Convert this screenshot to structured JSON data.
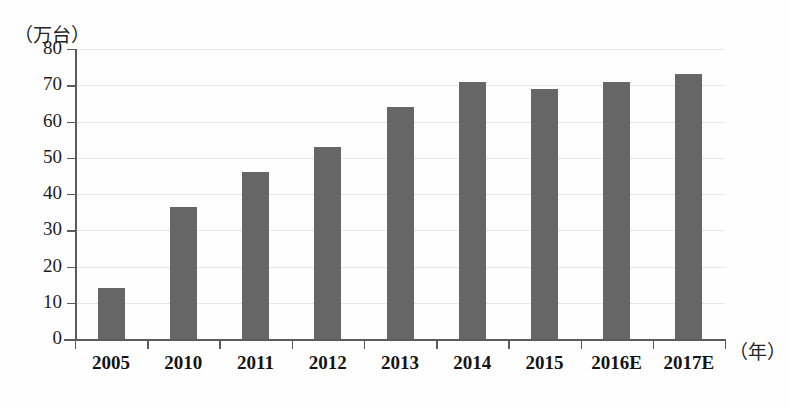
{
  "chart_data": {
    "type": "bar",
    "title": "",
    "subtitle": "",
    "xlabel": "（年）",
    "ylabel": "（万台）",
    "categories": [
      "2005",
      "2010",
      "2011",
      "2012",
      "2013",
      "2014",
      "2015",
      "2016E",
      "2017E"
    ],
    "values": [
      14,
      36.5,
      46,
      53,
      64,
      71,
      69,
      71,
      73
    ],
    "ylim": [
      0,
      80
    ],
    "ytick_labels": [
      "0",
      "10",
      "20",
      "30",
      "40",
      "50",
      "60",
      "70",
      "80"
    ],
    "ytick_values": [
      0,
      10,
      20,
      30,
      40,
      50,
      60,
      70,
      80
    ],
    "grid": true,
    "grid_axis": "y",
    "legend": "none",
    "series": [
      {
        "name": "",
        "color": "#666666",
        "values": [
          14,
          36.5,
          46,
          53,
          64,
          71,
          69,
          71,
          73
        ]
      }
    ],
    "annotations": []
  },
  "axes": {
    "y_unit_label": "（万台）",
    "x_unit_label": "（年）",
    "axis_color": "#5b5b5b",
    "grid_color": "#e6e6e6"
  }
}
